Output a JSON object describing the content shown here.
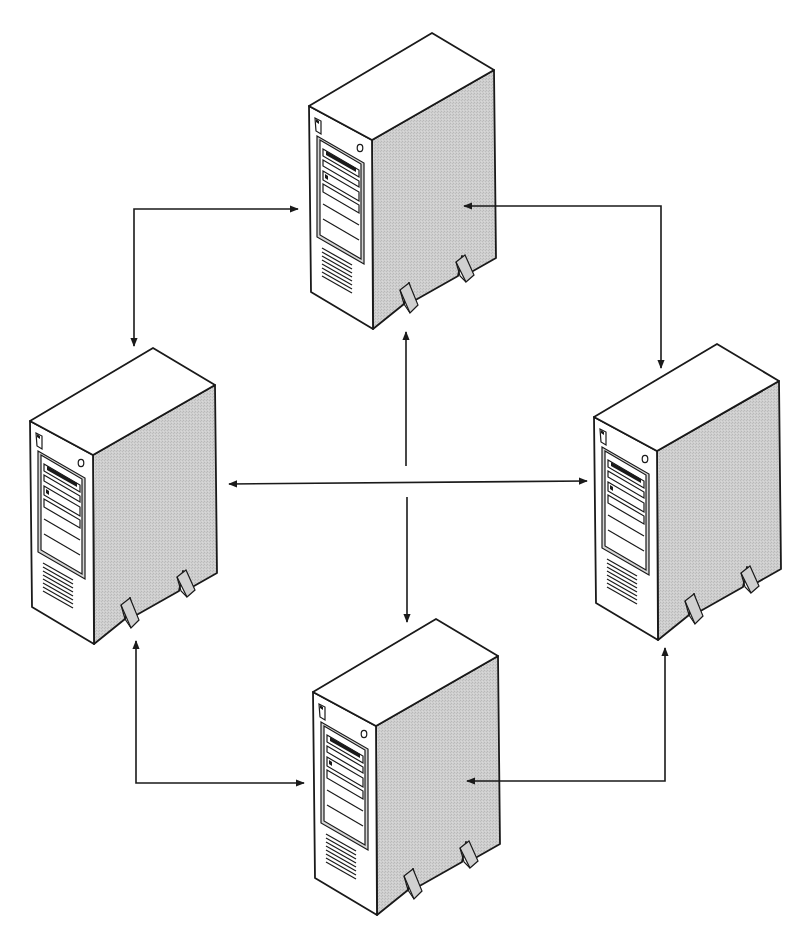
{
  "diagram": {
    "title": "Peer-to-peer server network",
    "colors": {
      "background": "#ffffff",
      "line": "#1a1a1a",
      "server_top": "#ffffff",
      "server_front": "#ffffff",
      "server_side": "#c9c9c9",
      "arrow": "#1a1a1a"
    }
  },
  "nodes": [
    {
      "id": "server-top",
      "label": "Server (top)",
      "icon": "tower-server-icon",
      "x": 0,
      "y": 0
    },
    {
      "id": "server-left",
      "label": "Server (left)",
      "icon": "tower-server-icon",
      "x": -279,
      "y": 315
    },
    {
      "id": "server-right",
      "label": "Server (right)",
      "icon": "tower-server-icon",
      "x": 285,
      "y": 311
    },
    {
      "id": "server-bottom",
      "label": "Server (bottom)",
      "icon": "tower-server-icon",
      "x": 4,
      "y": 586
    }
  ],
  "connections": [
    {
      "id": "top-left",
      "from": "server-top",
      "to": "server-left",
      "type": "bidirectional-elbow"
    },
    {
      "id": "top-right",
      "from": "server-top",
      "to": "server-right",
      "type": "bidirectional-elbow"
    },
    {
      "id": "left-bottom",
      "from": "server-left",
      "to": "server-bottom",
      "type": "bidirectional-elbow"
    },
    {
      "id": "right-bottom",
      "from": "server-right",
      "to": "server-bottom",
      "type": "bidirectional-elbow"
    },
    {
      "id": "left-right",
      "from": "server-left",
      "to": "server-right",
      "type": "bidirectional-straight"
    },
    {
      "id": "center-to-top",
      "from": "center",
      "to": "server-top",
      "type": "arrow"
    },
    {
      "id": "center-to-bottom",
      "from": "center",
      "to": "server-bottom",
      "type": "arrow"
    }
  ]
}
